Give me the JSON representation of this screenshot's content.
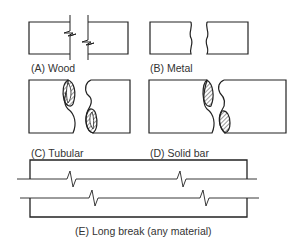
{
  "figure": {
    "panels": [
      {
        "id": "A",
        "label": "(A) Wood",
        "break_type": "wood"
      },
      {
        "id": "B",
        "label": "(B) Metal",
        "break_type": "metal"
      },
      {
        "id": "C",
        "label": "(C) Tubular",
        "break_type": "tubular"
      },
      {
        "id": "D",
        "label": "(D) Solid bar",
        "break_type": "solid-bar"
      },
      {
        "id": "E",
        "label": "(E) Long break (any material)",
        "break_type": "long-break"
      }
    ],
    "colors": {
      "stroke": "#222222",
      "hatch": "#333333",
      "text": "#333333",
      "background": "#ffffff"
    }
  }
}
